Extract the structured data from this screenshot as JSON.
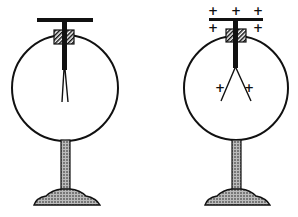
{
  "diagram": {
    "left": {
      "state": "uncharged",
      "leaves": "closed"
    },
    "right": {
      "state": "charged",
      "leaves": "diverged",
      "charge_symbol": "+",
      "top_plus": [
        "+",
        "+",
        "+"
      ],
      "side_plus": [
        "+",
        "+"
      ],
      "leaf_plus": [
        "+",
        "+"
      ]
    }
  },
  "colors": {
    "ink": "#111111",
    "background": "#ffffff"
  }
}
